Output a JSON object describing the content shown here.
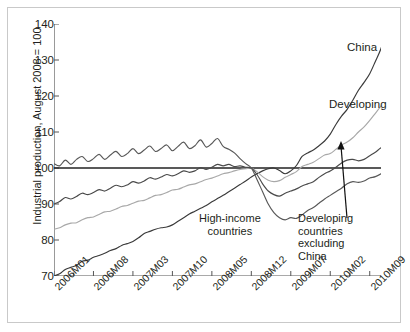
{
  "figure": {
    "ylabel": "Industrial production, August 2008 = 100"
  },
  "chart_data": {
    "type": "line",
    "title": "",
    "xlabel": "",
    "ylabel": "Industrial production, August 2008 = 100",
    "ylim": [
      70,
      140
    ],
    "yticks": [
      70,
      80,
      90,
      100,
      110,
      120,
      130,
      140
    ],
    "grid": false,
    "legend_position": "inline-annotations",
    "reference_line": {
      "value": 100,
      "label": "August 2008 = 100"
    },
    "x_tick_labels": [
      "2006M01",
      "2006M08",
      "2007M03",
      "2007M10",
      "2008M05",
      "2008M12",
      "2009M07",
      "2010M02",
      "2010M09"
    ],
    "x_tick_index": [
      0,
      7,
      14,
      21,
      28,
      35,
      42,
      49,
      56
    ],
    "x_minor_every_months": 3.5,
    "x_start": "2006M01",
    "x_end": "2010M11",
    "n_points": 59,
    "annotations": [
      {
        "name": "china-label",
        "text": "China"
      },
      {
        "name": "developing-label",
        "text": "Developing"
      },
      {
        "name": "high-income-label",
        "text": "High-income\ncountries"
      },
      {
        "name": "developing-excl-china-label",
        "text": "Developing\ncountries\nexcluding\nChina"
      }
    ],
    "series": [
      {
        "name": "China",
        "color": "#3a3a3a",
        "values": [
          70.0,
          70.6,
          71.8,
          72.4,
          73.0,
          74.1,
          74.4,
          75.2,
          75.7,
          76.3,
          77.1,
          77.6,
          78.5,
          79.0,
          79.6,
          80.6,
          81.8,
          82.4,
          83.0,
          83.4,
          83.6,
          84.2,
          85.2,
          86.2,
          87.2,
          88.0,
          88.8,
          89.6,
          90.6,
          91.5,
          92.4,
          93.4,
          94.4,
          95.4,
          96.4,
          97.5,
          98.4,
          99.2,
          99.8,
          100.0,
          99.3,
          98.4,
          99.2,
          100.7,
          103.2,
          104.2,
          105.0,
          106.2,
          107.5,
          109.4,
          112.1,
          114.4,
          116.3,
          118.8,
          121.6,
          123.8,
          126.2,
          129.6,
          133.2,
          138.4
        ]
      },
      {
        "name": "Developing",
        "color": "#a8a8a8",
        "values": [
          83.0,
          83.4,
          84.2,
          84.7,
          84.8,
          85.6,
          86.2,
          86.4,
          87.1,
          87.8,
          88.0,
          88.6,
          89.3,
          89.6,
          90.2,
          90.8,
          91.0,
          91.7,
          92.4,
          92.6,
          93.2,
          93.9,
          94.1,
          94.7,
          95.3,
          95.6,
          96.2,
          96.8,
          97.2,
          97.8,
          98.4,
          98.7,
          99.2,
          99.6,
          99.8,
          100.0,
          99.0,
          97.6,
          96.6,
          96.2,
          96.5,
          97.4,
          98.2,
          99.0,
          100.4,
          101.0,
          101.6,
          102.6,
          103.6,
          104.0,
          105.2,
          106.4,
          107.2,
          108.4,
          110.0,
          111.4,
          113.2,
          115.2,
          117.2,
          119.4
        ]
      },
      {
        "name": "Developing countries excluding China",
        "color": "#4a4a4a",
        "values": [
          90.0,
          90.7,
          91.8,
          91.4,
          92.1,
          93.0,
          92.6,
          93.2,
          94.0,
          93.6,
          94.4,
          95.2,
          94.8,
          95.3,
          96.2,
          95.8,
          96.4,
          97.3,
          96.9,
          97.5,
          98.2,
          97.8,
          98.4,
          99.2,
          98.8,
          99.2,
          100.1,
          99.6,
          100.2,
          101.0,
          100.6,
          101.0,
          100.4,
          100.6,
          100.2,
          100.0,
          98.2,
          95.6,
          93.6,
          92.6,
          92.2,
          93.0,
          93.6,
          94.2,
          95.0,
          95.6,
          96.2,
          97.4,
          98.4,
          99.2,
          100.2,
          101.4,
          102.2,
          102.4,
          102.0,
          102.4,
          103.4,
          104.4,
          105.6,
          106.4
        ]
      },
      {
        "name": "High-income countries",
        "color": "#585858",
        "values": [
          101.2,
          100.6,
          102.2,
          101.0,
          102.4,
          103.2,
          101.8,
          102.6,
          103.8,
          102.4,
          103.6,
          104.6,
          103.2,
          104.0,
          105.4,
          104.0,
          105.0,
          106.1,
          104.6,
          105.4,
          106.4,
          104.8,
          106.0,
          107.2,
          105.4,
          106.2,
          107.8,
          105.8,
          106.8,
          108.2,
          106.0,
          105.2,
          104.2,
          102.6,
          101.2,
          100.0,
          96.8,
          93.4,
          90.0,
          87.6,
          86.2,
          85.6,
          86.2,
          86.0,
          87.0,
          88.2,
          89.0,
          90.2,
          91.4,
          92.4,
          93.4,
          94.4,
          95.6,
          96.2,
          96.0,
          96.4,
          97.2,
          97.6,
          98.4,
          99.4
        ]
      }
    ]
  }
}
